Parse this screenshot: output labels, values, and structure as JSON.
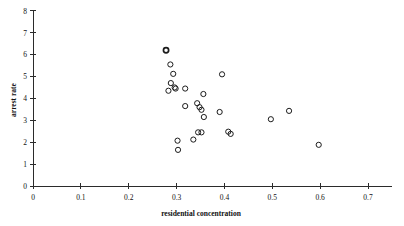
{
  "chart_data": {
    "type": "scatter",
    "title": "",
    "xlabel": "residential concentration",
    "ylabel": "arrest rate",
    "xlim": [
      0,
      0.75
    ],
    "ylim": [
      0,
      8
    ],
    "xticks": [
      0,
      0.1,
      0.2,
      0.3,
      0.4,
      0.5,
      0.6,
      0.7
    ],
    "xtick_labels": [
      "0",
      "0.1",
      "0.2",
      "0.3",
      "0.4",
      "0.5",
      "0.6",
      "0.7"
    ],
    "yticks": [
      0,
      1,
      2,
      3,
      4,
      5,
      6,
      7,
      8
    ],
    "ytick_labels": [
      "0",
      "1",
      "2",
      "3",
      "4",
      "5",
      "6",
      "7",
      "8"
    ],
    "grid": false,
    "legend": null,
    "marker": "open-circle",
    "series": [
      {
        "name": "observations",
        "points": [
          {
            "x": 0.278,
            "y": 6.2,
            "emphasis": "overlapping-pair"
          },
          {
            "x": 0.287,
            "y": 5.55
          },
          {
            "x": 0.293,
            "y": 5.12
          },
          {
            "x": 0.288,
            "y": 4.7
          },
          {
            "x": 0.283,
            "y": 4.35
          },
          {
            "x": 0.296,
            "y": 4.5
          },
          {
            "x": 0.298,
            "y": 4.45
          },
          {
            "x": 0.318,
            "y": 4.45
          },
          {
            "x": 0.318,
            "y": 3.65
          },
          {
            "x": 0.343,
            "y": 3.78
          },
          {
            "x": 0.348,
            "y": 3.6
          },
          {
            "x": 0.352,
            "y": 3.48
          },
          {
            "x": 0.356,
            "y": 4.2
          },
          {
            "x": 0.357,
            "y": 3.15
          },
          {
            "x": 0.39,
            "y": 3.38
          },
          {
            "x": 0.395,
            "y": 5.1
          },
          {
            "x": 0.345,
            "y": 2.45
          },
          {
            "x": 0.352,
            "y": 2.45
          },
          {
            "x": 0.335,
            "y": 2.12
          },
          {
            "x": 0.302,
            "y": 2.07
          },
          {
            "x": 0.303,
            "y": 1.65
          },
          {
            "x": 0.408,
            "y": 2.48
          },
          {
            "x": 0.413,
            "y": 2.38
          },
          {
            "x": 0.497,
            "y": 3.05
          },
          {
            "x": 0.535,
            "y": 3.43
          },
          {
            "x": 0.597,
            "y": 1.88
          }
        ]
      }
    ]
  },
  "axes": {
    "x_axis_name": "x-axis",
    "y_axis_name": "y-axis"
  }
}
